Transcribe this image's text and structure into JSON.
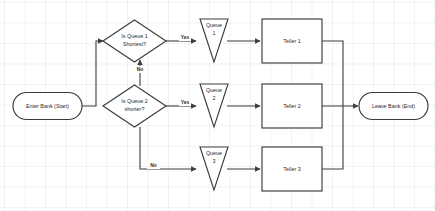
{
  "diagram": {
    "type": "flowchart",
    "nodes": {
      "start": {
        "label": "Enter Bank (Start)",
        "shape": "stadium"
      },
      "decision1": {
        "label_line1": "Is Queue 1",
        "label_line2": "Shortest?",
        "shape": "diamond"
      },
      "decision2": {
        "label_line1": "Is Queue 2",
        "label_line2": "shorter?",
        "shape": "diamond"
      },
      "queue1": {
        "label_line1": "Queue",
        "label_line2": "1",
        "shape": "triangle-down"
      },
      "queue2": {
        "label_line1": "Queue",
        "label_line2": "2",
        "shape": "triangle-down"
      },
      "queue3": {
        "label_line1": "Queue",
        "label_line2": "3",
        "shape": "triangle-down"
      },
      "teller1": {
        "label": "Teller 1",
        "shape": "rectangle"
      },
      "teller2": {
        "label": "Teller 2",
        "shape": "rectangle"
      },
      "teller3": {
        "label": "Teller 3",
        "shape": "rectangle"
      },
      "end": {
        "label": "Leave Bank (End)",
        "shape": "stadium"
      }
    },
    "edge_labels": {
      "d1_yes": "Yes",
      "d2_yes": "Yes",
      "d2_to_d1_no": "No",
      "d2_no": "No"
    },
    "colors": {
      "stroke": "#3c3c3c",
      "text": "#2b2b2b",
      "background": "#ffffff",
      "grid": "#96a0af"
    }
  }
}
